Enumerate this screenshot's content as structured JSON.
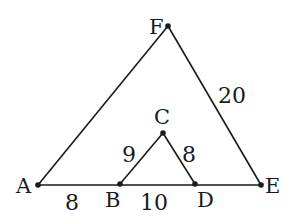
{
  "diagram": {
    "stroke_color": "#1a1a1a",
    "background": "#ffffff",
    "points": {
      "A": {
        "label": "A",
        "x": 38,
        "y": 185
      },
      "B": {
        "label": "B",
        "x": 120,
        "y": 184
      },
      "C": {
        "label": "C",
        "x": 163,
        "y": 133
      },
      "D": {
        "label": "D",
        "x": 195,
        "y": 184
      },
      "E": {
        "label": "E",
        "x": 261,
        "y": 185
      },
      "F": {
        "label": "F",
        "x": 168,
        "y": 26
      }
    },
    "segments": [
      {
        "from": "A",
        "to": "E"
      },
      {
        "from": "A",
        "to": "F"
      },
      {
        "from": "F",
        "to": "E"
      },
      {
        "from": "B",
        "to": "C"
      },
      {
        "from": "C",
        "to": "D"
      }
    ],
    "lengths": {
      "AB": "8",
      "BD": "10",
      "BC": "9",
      "CD": "8",
      "FE": "20"
    }
  }
}
